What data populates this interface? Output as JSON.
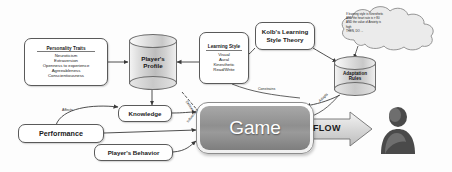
{
  "diagram": {
    "personality": {
      "title": "Personality Traits",
      "items": [
        "Neuroticism",
        "Extraversion",
        "Openness to experience",
        "Agreeableness",
        "Conscientiousness"
      ]
    },
    "learning_style": {
      "title": "Learning Style",
      "items": [
        "Visual",
        "Aural",
        "Kinesthetic",
        "Read/Write"
      ]
    },
    "kolb": {
      "line1": "Kolb's Learning",
      "line2": "Style Theory"
    },
    "player_profile": {
      "line1": "Player's",
      "line2": "Profile"
    },
    "adaptation_rules": {
      "line1": "Adaptation",
      "line2": "Rules"
    },
    "rule_cloud": {
      "line1": "If learning style is Kinesthetic",
      "line2": "AND the heart rate is > 80",
      "line3": "AND the value of Anxiety is",
      "line4": "high",
      "line5": "THEN, DO ..."
    },
    "knowledge": "Knowledge",
    "performance": "Performance",
    "player_behavior": "Player's Behavior",
    "game": "Game",
    "flow": "FLOW",
    "edges": {
      "affects": "Affects",
      "constrains": "Constrains",
      "defines": "Defines",
      "adapts": "Adapts",
      "influences": "Influences"
    },
    "colors": {
      "game_fill": "#8f8f8f",
      "border": "#5a5a5a",
      "arrow": "#3a3a3a",
      "person": "#555555"
    }
  }
}
